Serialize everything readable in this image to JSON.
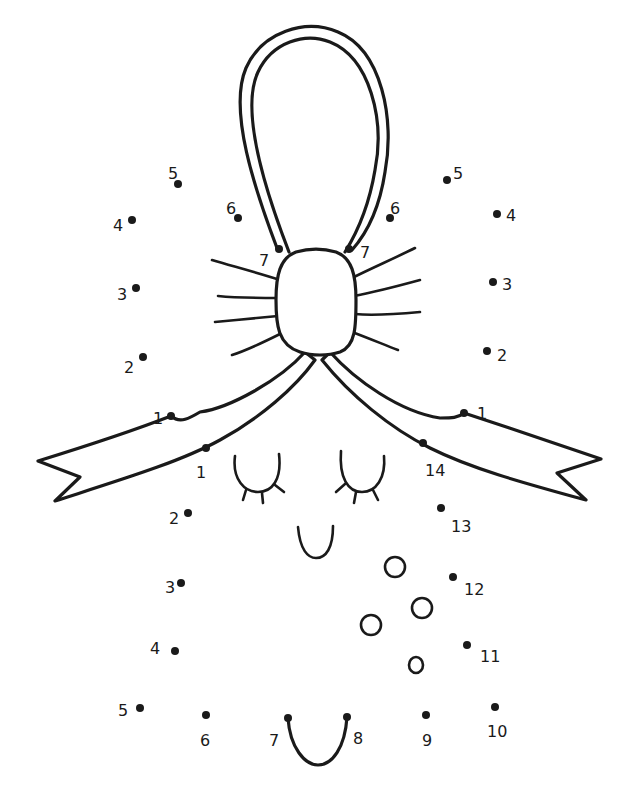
{
  "puzzle": {
    "type": "dot-to-dot",
    "subject": "gingerbread ornament with bow",
    "colors": {
      "ink": "#1a1a1a",
      "background": "#ffffff"
    }
  },
  "dots": {
    "left_top": [
      {
        "label": "1",
        "x": 171,
        "y": 416,
        "lx": 153,
        "ly": 418
      },
      {
        "label": "2",
        "x": 143,
        "y": 357,
        "lx": 124,
        "ly": 367
      },
      {
        "label": "3",
        "x": 136,
        "y": 288,
        "lx": 117,
        "ly": 294
      },
      {
        "label": "4",
        "x": 132,
        "y": 220,
        "lx": 113,
        "ly": 225
      },
      {
        "label": "5",
        "x": 178,
        "y": 184,
        "lx": 168,
        "ly": 173
      },
      {
        "label": "6",
        "x": 238,
        "y": 218,
        "lx": 226,
        "ly": 208
      },
      {
        "label": "7",
        "x": 279,
        "y": 249,
        "lx": 259,
        "ly": 260
      }
    ],
    "right_top": [
      {
        "label": "1",
        "x": 464,
        "y": 413,
        "lx": 477,
        "ly": 413
      },
      {
        "label": "2",
        "x": 487,
        "y": 351,
        "lx": 497,
        "ly": 355
      },
      {
        "label": "3",
        "x": 493,
        "y": 282,
        "lx": 502,
        "ly": 284
      },
      {
        "label": "4",
        "x": 497,
        "y": 214,
        "lx": 506,
        "ly": 215
      },
      {
        "label": "5",
        "x": 447,
        "y": 180,
        "lx": 453,
        "ly": 173
      },
      {
        "label": "6",
        "x": 390,
        "y": 218,
        "lx": 390,
        "ly": 208
      },
      {
        "label": "7",
        "x": 349,
        "y": 249,
        "lx": 360,
        "ly": 252
      }
    ],
    "bottom": [
      {
        "label": "1",
        "x": 206,
        "y": 448,
        "lx": 196,
        "ly": 472
      },
      {
        "label": "2",
        "x": 188,
        "y": 513,
        "lx": 169,
        "ly": 518
      },
      {
        "label": "3",
        "x": 181,
        "y": 583,
        "lx": 165,
        "ly": 587
      },
      {
        "label": "4",
        "x": 175,
        "y": 651,
        "lx": 150,
        "ly": 648
      },
      {
        "label": "5",
        "x": 140,
        "y": 708,
        "lx": 118,
        "ly": 710
      },
      {
        "label": "6",
        "x": 206,
        "y": 715,
        "lx": 200,
        "ly": 740
      },
      {
        "label": "7",
        "x": 288,
        "y": 718,
        "lx": 269,
        "ly": 740
      },
      {
        "label": "8",
        "x": 347,
        "y": 717,
        "lx": 353,
        "ly": 738
      },
      {
        "label": "9",
        "x": 426,
        "y": 715,
        "lx": 422,
        "ly": 740
      },
      {
        "label": "10",
        "x": 495,
        "y": 707,
        "lx": 487,
        "ly": 731
      },
      {
        "label": "11",
        "x": 467,
        "y": 645,
        "lx": 480,
        "ly": 656
      },
      {
        "label": "12",
        "x": 453,
        "y": 577,
        "lx": 464,
        "ly": 589
      },
      {
        "label": "13",
        "x": 441,
        "y": 508,
        "lx": 451,
        "ly": 526
      },
      {
        "label": "14",
        "x": 423,
        "y": 443,
        "lx": 425,
        "ly": 470
      }
    ]
  }
}
